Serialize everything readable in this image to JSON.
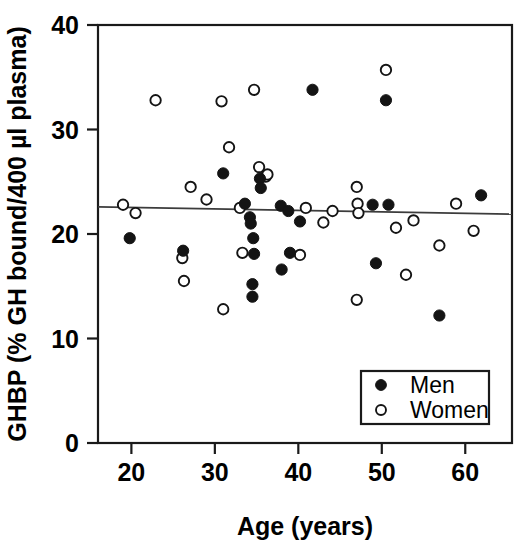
{
  "chart_data": {
    "type": "scatter",
    "title": "",
    "xlabel": "Age (years)",
    "ylabel": "GHBP (% GH bound/400 µl plasma)",
    "xlim": [
      16,
      65.6
    ],
    "ylim": [
      0,
      40
    ],
    "xticks": [
      20,
      30,
      40,
      50,
      60
    ],
    "xtick_labels": [
      "20",
      "30",
      "40",
      "50",
      "60"
    ],
    "yticks": [
      0,
      10,
      20,
      30,
      40
    ],
    "ytick_labels": [
      "0",
      "10",
      "20",
      "30",
      "40"
    ],
    "grid": false,
    "legend_position": "lower right",
    "legend": [
      {
        "name": "Men",
        "marker": "filled-circle",
        "color": "#141414"
      },
      {
        "name": "Women",
        "marker": "open-circle",
        "color": "#ffffff"
      }
    ],
    "trendline": {
      "label": "",
      "x": [
        16.0,
        65.6
      ],
      "y": [
        22.6,
        21.9
      ]
    },
    "series": [
      {
        "name": "Men",
        "marker": "filled-circle",
        "points": [
          [
            19.8,
            19.6
          ],
          [
            26.2,
            18.4
          ],
          [
            31.0,
            25.8
          ],
          [
            33.6,
            22.9
          ],
          [
            34.2,
            21.6
          ],
          [
            34.3,
            21.0
          ],
          [
            34.6,
            19.6
          ],
          [
            34.7,
            18.1
          ],
          [
            34.5,
            15.2
          ],
          [
            34.5,
            14.0
          ],
          [
            35.4,
            25.3
          ],
          [
            35.5,
            24.4
          ],
          [
            37.9,
            22.7
          ],
          [
            38.0,
            16.6
          ],
          [
            38.8,
            22.2
          ],
          [
            39.0,
            18.2
          ],
          [
            40.2,
            21.2
          ],
          [
            41.7,
            33.8
          ],
          [
            48.9,
            22.8
          ],
          [
            50.8,
            22.8
          ],
          [
            50.5,
            32.8
          ],
          [
            49.3,
            17.2
          ],
          [
            56.9,
            12.2
          ],
          [
            61.9,
            23.7
          ]
        ]
      },
      {
        "name": "Women",
        "marker": "open-circle",
        "points": [
          [
            19.0,
            22.8
          ],
          [
            20.5,
            22.0
          ],
          [
            22.9,
            32.8
          ],
          [
            26.1,
            17.7
          ],
          [
            26.3,
            15.5
          ],
          [
            27.1,
            24.5
          ],
          [
            29.0,
            23.3
          ],
          [
            30.8,
            32.7
          ],
          [
            31.0,
            12.8
          ],
          [
            31.7,
            28.3
          ],
          [
            33.0,
            22.5
          ],
          [
            33.3,
            18.2
          ],
          [
            34.7,
            33.8
          ],
          [
            35.3,
            26.4
          ],
          [
            36.1,
            25.5
          ],
          [
            36.3,
            25.7
          ],
          [
            40.2,
            18.0
          ],
          [
            40.9,
            22.5
          ],
          [
            43.0,
            21.1
          ],
          [
            44.1,
            22.2
          ],
          [
            47.0,
            24.5
          ],
          [
            47.1,
            22.9
          ],
          [
            47.2,
            22.0
          ],
          [
            47.0,
            13.7
          ],
          [
            50.5,
            35.7
          ],
          [
            51.7,
            20.6
          ],
          [
            52.9,
            16.1
          ],
          [
            53.8,
            21.3
          ],
          [
            56.9,
            18.9
          ],
          [
            58.9,
            22.9
          ],
          [
            61.0,
            20.3
          ]
        ]
      }
    ]
  },
  "axes": {
    "x_title": "Age (years)",
    "y_title": "GHBP (% GH bound/400 µl plasma)"
  },
  "legend": {
    "men_label": "Men",
    "women_label": "Women"
  }
}
